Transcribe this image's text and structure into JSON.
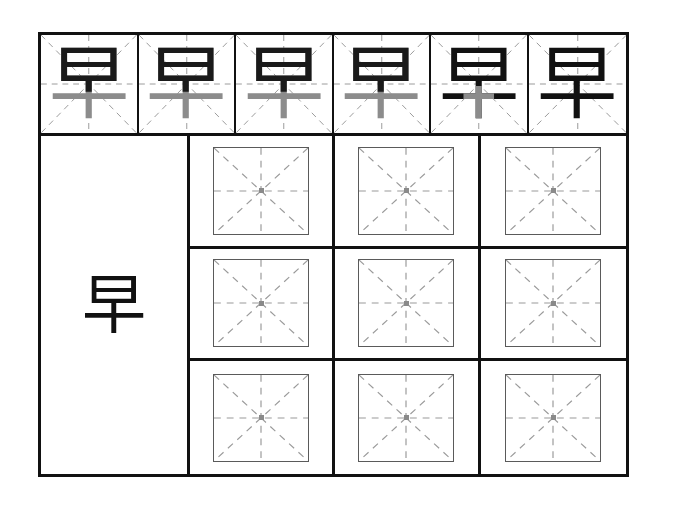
{
  "worksheet": {
    "title": "Chinese character handwriting practice sheet",
    "character": "早",
    "character_pinyin": "zǎo",
    "stroke_count": 6,
    "paper_color": "#ffffff",
    "frame_color": "#111111",
    "guide_color": "#9a9a9a",
    "ink_dark": "#111111",
    "ink_light": "#8c8c8c",
    "inner_box_border": "#5a5a5a"
  },
  "demo_strip": {
    "name": "stroke-order-demo-row",
    "cell_count": 6,
    "cells": [
      {
        "index": 1,
        "character": "早",
        "shading": "top-dark-bottom-light",
        "top_color": "#1a1a1a",
        "mid_color": "#8c8c8c",
        "stem_color": "#8c8c8c",
        "completed_strokes": 4
      },
      {
        "index": 2,
        "character": "早",
        "shading": "top-dark-bottom-light",
        "top_color": "#1a1a1a",
        "mid_color": "#8c8c8c",
        "stem_color": "#8c8c8c",
        "completed_strokes": 4
      },
      {
        "index": 3,
        "character": "早",
        "shading": "top-dark-bottom-light",
        "top_color": "#1a1a1a",
        "mid_color": "#7a7a7a",
        "stem_color": "#8c8c8c",
        "completed_strokes": 4
      },
      {
        "index": 4,
        "character": "早",
        "shading": "top-dark-mid-light",
        "top_color": "#1a1a1a",
        "mid_color": "#8c8c8c",
        "stem_color": "#8c8c8c",
        "completed_strokes": 5
      },
      {
        "index": 5,
        "character": "早",
        "shading": "all-dark-stem-light",
        "top_color": "#111111",
        "mid_color": "#111111",
        "stem_color": "#8c8c8c",
        "completed_strokes": 5
      },
      {
        "index": 6,
        "character": "早",
        "shading": "all-dark",
        "top_color": "#111111",
        "mid_color": "#111111",
        "stem_color": "#111111",
        "completed_strokes": 6
      }
    ]
  },
  "model_cell": {
    "name": "model-character-cell",
    "character": "早",
    "color": "#111111"
  },
  "practice_grid": {
    "name": "practice-grid",
    "rows": 3,
    "columns": 3,
    "cell_count": 9,
    "cell_type": "mi-zi-ge",
    "cells": [
      {
        "row": 1,
        "col": 1,
        "character": ""
      },
      {
        "row": 1,
        "col": 2,
        "character": ""
      },
      {
        "row": 1,
        "col": 3,
        "character": ""
      },
      {
        "row": 2,
        "col": 1,
        "character": ""
      },
      {
        "row": 2,
        "col": 2,
        "character": ""
      },
      {
        "row": 2,
        "col": 3,
        "character": ""
      },
      {
        "row": 3,
        "col": 1,
        "character": ""
      },
      {
        "row": 3,
        "col": 2,
        "character": ""
      },
      {
        "row": 3,
        "col": 3,
        "character": ""
      }
    ]
  }
}
